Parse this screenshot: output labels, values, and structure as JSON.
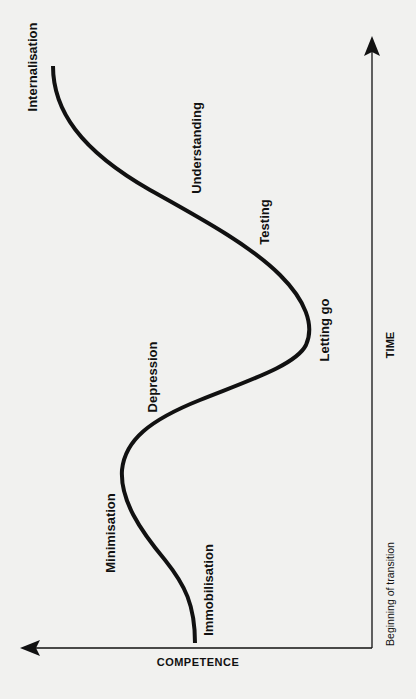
{
  "diagram": {
    "type": "transition-curve",
    "axes": {
      "vertical": {
        "label": "TIME",
        "start_label": "Beginning of transition"
      },
      "horizontal": {
        "label": "COMPETENCE"
      }
    },
    "stages": [
      {
        "id": "immobilisation",
        "label": "Immobilisation"
      },
      {
        "id": "minimisation",
        "label": "Minimisation"
      },
      {
        "id": "depression",
        "label": "Depression"
      },
      {
        "id": "letting-go",
        "label": "Letting go"
      },
      {
        "id": "testing",
        "label": "Testing"
      },
      {
        "id": "understanding",
        "label": "Understanding"
      },
      {
        "id": "internalisation",
        "label": "Internalisation"
      }
    ],
    "colors": {
      "line": "#111111",
      "background": "#f1f1ef"
    }
  }
}
